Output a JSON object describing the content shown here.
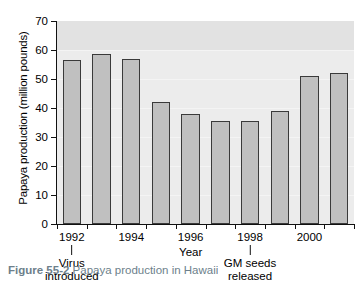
{
  "figure": {
    "caption_label": "Figure 55-2",
    "caption_text": "Papaya production in Hawaii"
  },
  "chart_data": {
    "type": "bar",
    "title": "",
    "xlabel": "Year",
    "ylabel": "Papaya production (million pounds)",
    "categories": [
      "1992",
      "1993",
      "1994",
      "1995",
      "1996",
      "1997",
      "1998",
      "1999",
      "2000",
      "2001"
    ],
    "values": [
      56.5,
      58.5,
      57.0,
      42.0,
      38.0,
      35.5,
      35.5,
      39.0,
      51.0,
      52.0
    ],
    "ylim": [
      0,
      70
    ],
    "yticks": [
      0,
      10,
      20,
      30,
      40,
      50,
      60,
      70
    ],
    "ytick_labels": [
      "0",
      "10",
      "20",
      "30",
      "40",
      "50",
      "60",
      "70"
    ],
    "xtick_labels": [
      "1992",
      "1994",
      "1996",
      "1998",
      "2000"
    ],
    "xtick_categories": [
      "1992",
      "1994",
      "1996",
      "1998",
      "2000"
    ],
    "grid": false,
    "legend": "none",
    "bar_color": "#c0c0c0",
    "bar_edge_color": "#3a3a3a",
    "plot_background": "#e8e8e8",
    "annotations": [
      {
        "id": "virus",
        "category": "1992",
        "line1": "Virus",
        "line2": "introduced"
      },
      {
        "id": "gm-seeds",
        "category": "1998",
        "line1": "GM seeds",
        "line2": "released"
      }
    ]
  }
}
